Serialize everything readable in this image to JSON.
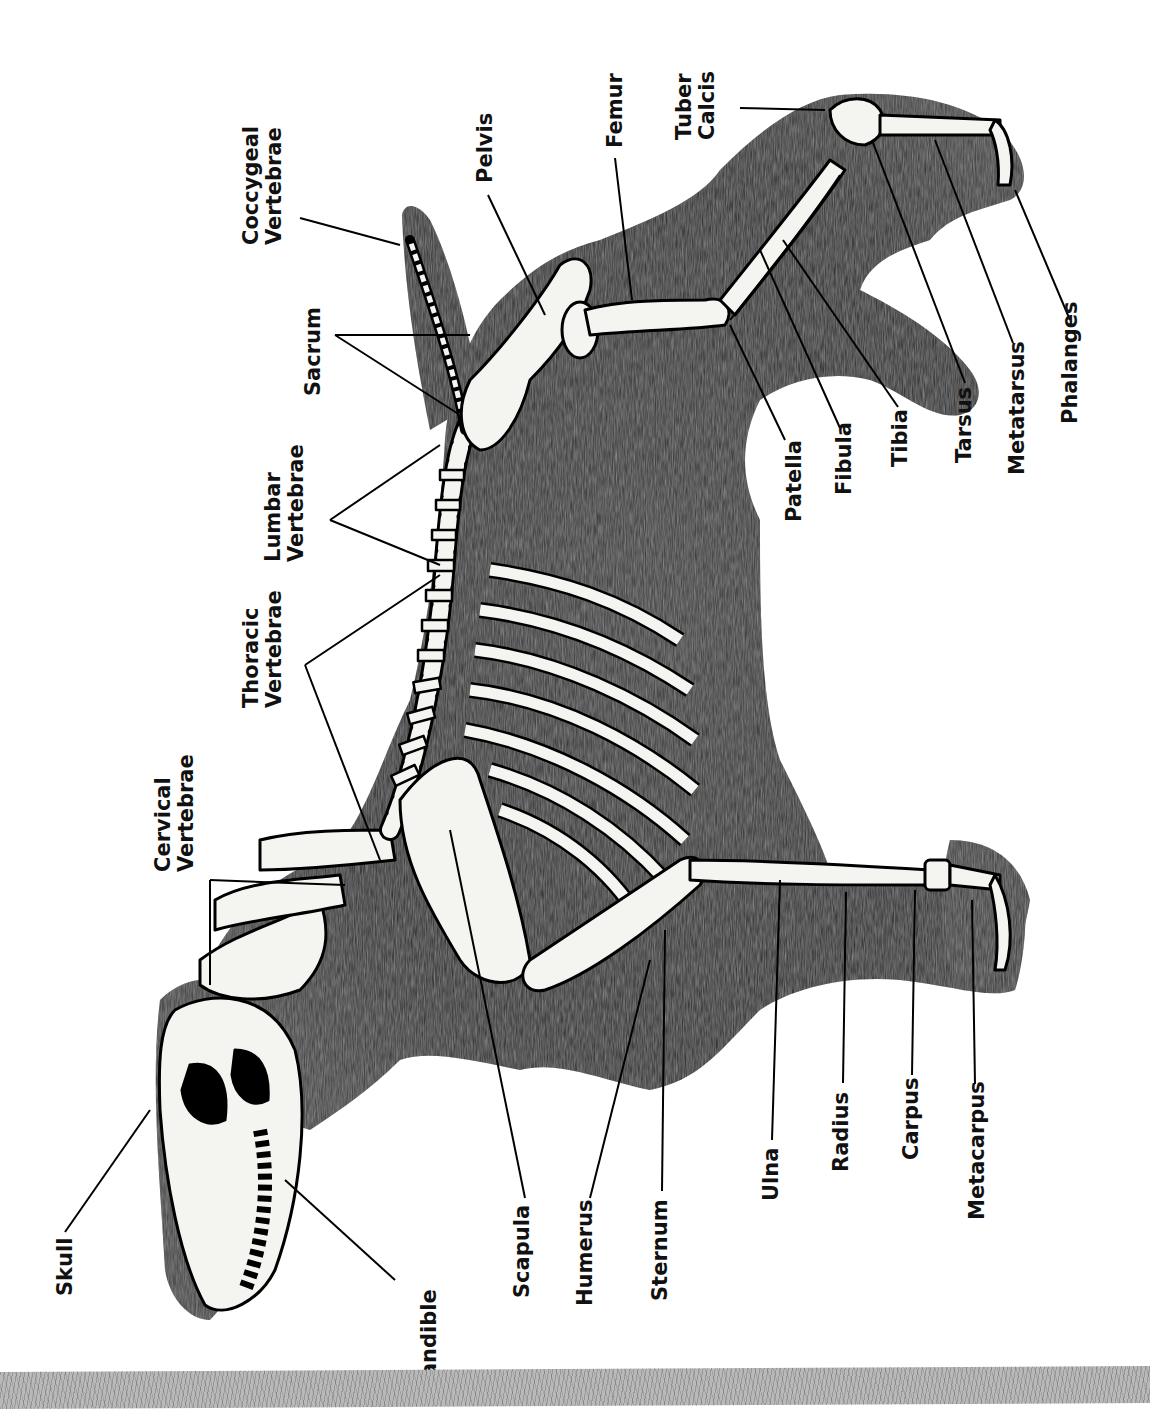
{
  "diagram": {
    "orientation": "rotated 90 degrees counter-clockwise (head at bottom-left, tail at top)",
    "colors": {
      "fur": "#2a2a2a",
      "bone": "#f4f4f0",
      "outline": "#000000",
      "label": "#111111",
      "background": "#ffffff",
      "footer": "#b9b9b9"
    },
    "labels": {
      "skull": "Skull",
      "mandible": "Mandible",
      "cervical": "Cervical\nVertebrae",
      "thoracic": "Thoracic\nVertebrae",
      "lumbar": "Lumbar\nVertebrae",
      "sacrum": "Sacrum",
      "coccygeal": "Coccygeal\nVertebrae",
      "pelvis": "Pelvis",
      "femur": "Femur",
      "tuber_calcis": "Tuber\nCalcis",
      "scapula": "Scapula",
      "humerus": "Humerus",
      "sternum": "Sternum",
      "ulna": "Ulna",
      "radius": "Radius",
      "carpus": "Carpus",
      "metacarpus": "Metacarpus",
      "patella": "Patella",
      "fibula": "Fibula",
      "tibia": "Tibia",
      "tarsus": "Tarsus",
      "metatarsus": "Metatarsus",
      "phalanges": "Phalanges"
    }
  }
}
